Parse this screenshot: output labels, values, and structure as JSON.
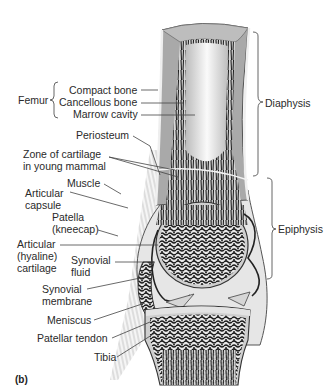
{
  "figure": {
    "panel_label": "(b)"
  },
  "group_labels": {
    "femur": "Femur",
    "diaphysis": "Diaphysis",
    "epiphysis": "Epiphysis"
  },
  "labels": [
    {
      "id": "compact-bone",
      "text": "Compact bone"
    },
    {
      "id": "cancellous-bone",
      "text": "Cancellous bone"
    },
    {
      "id": "marrow-cavity",
      "text": "Marrow cavity"
    },
    {
      "id": "periosteum",
      "text": "Periosteum"
    },
    {
      "id": "zone-cartilage",
      "lines": [
        "Zone of cartilage",
        "in young mammal"
      ]
    },
    {
      "id": "muscle",
      "text": "Muscle"
    },
    {
      "id": "articular-capsule",
      "lines": [
        "Articular",
        "capsule"
      ]
    },
    {
      "id": "patella",
      "lines": [
        "Patella",
        "(kneecap)"
      ]
    },
    {
      "id": "articular-cartilage",
      "lines": [
        "Articular",
        "(hyaline)",
        "cartilage"
      ]
    },
    {
      "id": "synovial-fluid",
      "lines": [
        "Synovial",
        "fluid"
      ]
    },
    {
      "id": "synovial-membrane",
      "lines": [
        "Synovial",
        "membrane"
      ]
    },
    {
      "id": "meniscus",
      "text": "Meniscus"
    },
    {
      "id": "patellar-tendon",
      "text": "Patellar tendon"
    },
    {
      "id": "tibia",
      "text": "Tibia"
    }
  ],
  "colors": {
    "compact_bone": "#a9a9a9",
    "cancellous_dark": "#1e1e1e",
    "marrow": "#f2f2f2",
    "cartilage": "#dcdcdc",
    "text": "#2a2a2a"
  }
}
